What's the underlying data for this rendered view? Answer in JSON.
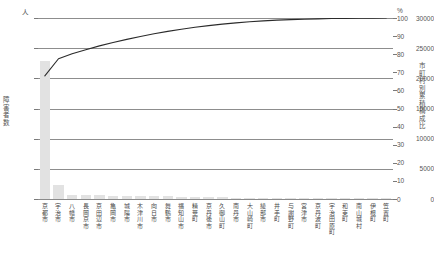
{
  "chart_data": {
    "type": "bar",
    "title": "",
    "subtitle": "",
    "xlabel": "",
    "ylabel": "障害者数",
    "ylabel_right": "市町村別累積構成比",
    "unit_left": "人",
    "unit_right": "%",
    "ylim": [
      0,
      30000
    ],
    "ylim_right": [
      0,
      100
    ],
    "yticks": [
      30000,
      25000,
      20000,
      15000,
      10000,
      5000,
      0
    ],
    "yticks_right": [
      100,
      90,
      80,
      70,
      60,
      50,
      40,
      30,
      20,
      10,
      0
    ],
    "grid": true,
    "legend": "none",
    "categories": [
      "京都市",
      "宇治市",
      "八幡市",
      "長岡京市",
      "京田辺市",
      "亀岡市",
      "城陽市",
      "木津川市",
      "向日市",
      "舞鶴市",
      "福知山市",
      "精華町",
      "京丹後市",
      "久御山町",
      "南丹市",
      "大山崎町",
      "綾部市",
      "井手町",
      "与謝野町",
      "宮津市",
      "京丹波町",
      "宇治田原町",
      "和束町",
      "南山城村",
      "伊根町",
      "笠置町"
    ],
    "series": [
      {
        "name": "障害者数",
        "type": "bar",
        "color": "#e2e2e2",
        "values": [
          22800,
          2300,
          700,
          650,
          600,
          560,
          520,
          480,
          450,
          420,
          380,
          330,
          300,
          260,
          230,
          200,
          180,
          150,
          130,
          110,
          95,
          80,
          65,
          50,
          35,
          20
        ]
      },
      {
        "name": "市町村別累積構成比",
        "type": "line",
        "color": "#2b2b2b",
        "values": [
          68.0,
          77.5,
          80.2,
          82.5,
          84.6,
          86.5,
          88.2,
          89.8,
          91.3,
          92.6,
          93.8,
          94.9,
          95.8,
          96.6,
          97.3,
          97.9,
          98.4,
          98.8,
          99.1,
          99.3,
          99.5,
          99.7,
          99.8,
          99.9,
          99.95,
          100.0
        ]
      }
    ]
  }
}
